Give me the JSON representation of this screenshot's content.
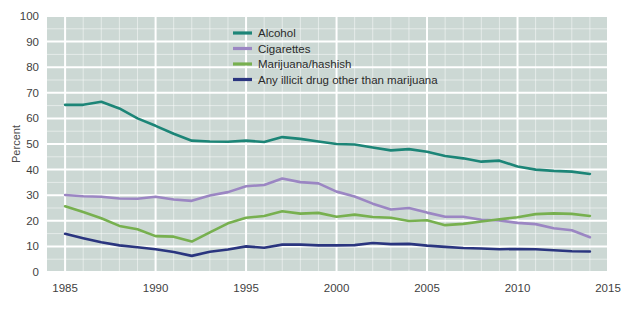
{
  "chart_data": {
    "type": "line",
    "title": "",
    "xlabel": "",
    "ylabel": "Percent",
    "xlim": [
      1984,
      2015
    ],
    "ylim": [
      0,
      100
    ],
    "grid": true,
    "legend_position": "top-center",
    "x_ticks": [
      "1985",
      "1990",
      "1995",
      "2000",
      "2005",
      "2010",
      "2015"
    ],
    "y_ticks": [
      "0",
      "10",
      "20",
      "30",
      "40",
      "50",
      "60",
      "70",
      "80",
      "90",
      "100"
    ],
    "x": [
      1985,
      1986,
      1987,
      1988,
      1989,
      1990,
      1991,
      1992,
      1993,
      1994,
      1995,
      1996,
      1997,
      1998,
      1999,
      2000,
      2001,
      2002,
      2003,
      2004,
      2005,
      2006,
      2007,
      2008,
      2009,
      2010,
      2011,
      2012,
      2013,
      2014
    ],
    "series": [
      {
        "name": "Alcohol",
        "color": "#1c8577",
        "values": [
          65.3,
          65.3,
          66.5,
          63.9,
          60.0,
          57.1,
          54.0,
          51.3,
          51.0,
          50.9,
          51.3,
          50.8,
          52.7,
          52.0,
          51.0,
          50.0,
          49.8,
          48.6,
          47.5,
          48.0,
          47.0,
          45.3,
          44.4,
          43.1,
          43.5,
          41.2,
          40.0,
          39.5,
          39.2,
          38.3
        ]
      },
      {
        "name": "Cigarettes",
        "color": "#9b86c3",
        "values": [
          30.1,
          29.6,
          29.4,
          28.7,
          28.6,
          29.4,
          28.3,
          27.8,
          29.9,
          31.2,
          33.5,
          34.0,
          36.5,
          35.1,
          34.6,
          31.4,
          29.5,
          26.7,
          24.4,
          25.0,
          23.2,
          21.6,
          21.6,
          20.4,
          20.1,
          19.2,
          18.7,
          17.1,
          16.3,
          13.6
        ]
      },
      {
        "name": "Marijuana/hashish",
        "color": "#77b04f",
        "values": [
          25.7,
          23.4,
          21.0,
          18.0,
          16.7,
          14.0,
          13.8,
          11.9,
          15.5,
          19.0,
          21.2,
          21.9,
          23.7,
          22.8,
          23.1,
          21.6,
          22.4,
          21.5,
          21.2,
          19.9,
          20.2,
          18.3,
          18.8,
          19.7,
          20.6,
          21.4,
          22.6,
          22.9,
          22.7,
          21.9
        ]
      },
      {
        "name": "Any illicit drug other than marijuana",
        "color": "#2a357f",
        "values": [
          14.9,
          13.2,
          11.6,
          10.4,
          9.7,
          8.9,
          7.8,
          6.3,
          7.9,
          8.8,
          10.0,
          9.5,
          10.7,
          10.7,
          10.4,
          10.4,
          10.5,
          11.3,
          10.9,
          11.0,
          10.3,
          9.8,
          9.4,
          9.2,
          8.9,
          9.0,
          8.9,
          8.5,
          8.1,
          8.0
        ]
      }
    ]
  },
  "chart": {
    "background_plot_color": "#ccd8d4",
    "grid_color": "#ffffff",
    "page_background": "#ffffff",
    "y_axis_title": "Percent"
  },
  "legend": {
    "items": [
      {
        "label": "Alcohol",
        "swatch": "#1c8577"
      },
      {
        "label": "Cigarettes",
        "swatch": "#9b86c3"
      },
      {
        "label": "Marijuana/hashish",
        "swatch": "#77b04f"
      },
      {
        "label": "Any illicit drug other than marijuana",
        "swatch": "#2a357f"
      }
    ]
  }
}
